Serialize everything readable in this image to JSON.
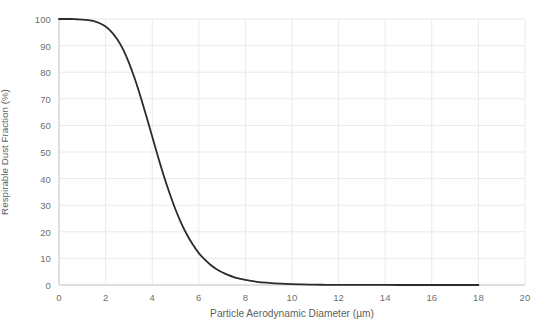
{
  "chart_data": {
    "type": "line",
    "title": "",
    "subtitle": "",
    "xlabel": "Particle Aerodynamic Diameter (µm)",
    "ylabel": "Respirable Dust Fraction (%)",
    "xlim": [
      0,
      20
    ],
    "ylim": [
      0,
      100
    ],
    "xticks": [
      0,
      2,
      4,
      6,
      8,
      10,
      12,
      14,
      16,
      18,
      20
    ],
    "yticks": [
      0,
      10,
      20,
      30,
      40,
      50,
      60,
      70,
      80,
      90,
      100
    ],
    "xtick_labels": [
      "0",
      "2",
      "4",
      "6",
      "8",
      "10",
      "12",
      "14",
      "16",
      "18",
      "20"
    ],
    "ytick_labels": [
      "0",
      "10",
      "20",
      "30",
      "40",
      "50",
      "60",
      "70",
      "80",
      "90",
      "100"
    ],
    "grid": true,
    "grid_color": "#eaeaea",
    "legend": null,
    "legend_position": "none",
    "annotations": [],
    "series": [
      {
        "name": "Respirable dust convention",
        "color": "#2b2b2b",
        "line_width": 1.8,
        "x": [
          0,
          0.25,
          0.5,
          0.75,
          1,
          1.25,
          1.5,
          1.75,
          2,
          2.25,
          2.5,
          2.75,
          3,
          3.25,
          3.5,
          3.75,
          4,
          4.25,
          4.5,
          4.75,
          5,
          5.25,
          5.5,
          5.75,
          6,
          6.25,
          6.5,
          6.75,
          7,
          7.25,
          7.5,
          7.75,
          8,
          8.5,
          9,
          9.5,
          10,
          10.5,
          11,
          11.5,
          12,
          12.5,
          13,
          13.5,
          14,
          15,
          16,
          17,
          18
        ],
        "y": [
          100,
          100,
          100,
          99.9,
          99.8,
          99.6,
          99.2,
          98.4,
          97.2,
          95.2,
          92.4,
          88.6,
          83.6,
          77.6,
          70.8,
          63.4,
          55.8,
          48.2,
          41.0,
          34.4,
          28.4,
          23.2,
          18.8,
          15.1,
          12.0,
          9.6,
          7.6,
          6.0,
          4.8,
          3.8,
          3.0,
          2.4,
          1.9,
          1.2,
          0.8,
          0.5,
          0.3,
          0.2,
          0.12,
          0.08,
          0.05,
          0.03,
          0.02,
          0.01,
          0.01,
          0,
          0,
          0,
          0
        ]
      }
    ]
  },
  "axes": {
    "x_title": "Particle Aerodynamic Diameter (µm)",
    "y_title": "Respirable Dust Fraction (%)"
  }
}
